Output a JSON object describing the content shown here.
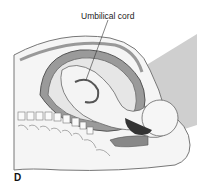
{
  "figure": {
    "labels": {
      "umbilical_cord": "Umbilical cord",
      "panel": "D"
    },
    "colors": {
      "outline": "#555555",
      "skin": "#f2f2f2",
      "uterus": "#8a8a8a",
      "dark": "#3a3a3a",
      "panel_bg": "#cfcfcf"
    }
  }
}
